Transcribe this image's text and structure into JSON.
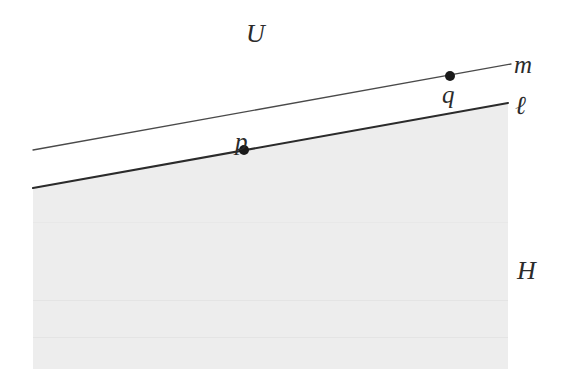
{
  "figure": {
    "type": "geometry-diagram",
    "width": 566,
    "height": 382,
    "background_color": "#ffffff"
  },
  "labels": {
    "ambient_space": "U",
    "upper_line": "m",
    "lower_line": "ℓ",
    "point_on_lower_line": "p",
    "point_on_upper_line": "q",
    "half_plane": "H"
  },
  "colors": {
    "line_upper": "#4a4a4a",
    "line_lower": "#2b2b2b",
    "half_plane_fill": "#ededed",
    "point_fill": "#1a1a1a",
    "label_text": "#2b2b2b"
  },
  "geometry": {
    "line_m": {
      "x1": 33,
      "y1": 150,
      "x2": 511,
      "y2": 64,
      "stroke_width": 1.3
    },
    "line_ell": {
      "x1": 33,
      "y1": 188,
      "x2": 508,
      "y2": 103,
      "stroke_width": 2.1
    },
    "half_plane_polygon": "33,188 508,103 508,369 33,369",
    "point_p": {
      "cx": 244,
      "cy": 150,
      "r": 5
    },
    "point_q": {
      "cx": 450,
      "cy": 76,
      "r": 5
    }
  }
}
